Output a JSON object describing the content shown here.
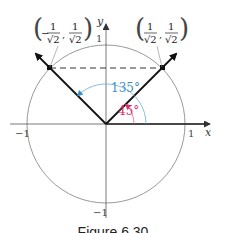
{
  "figure": {
    "caption": "Figure 6.30",
    "axes": {
      "x_label": "x",
      "y_label": "y"
    },
    "ticks": {
      "x_pos": "1",
      "x_neg": "−1",
      "y_pos": "1",
      "y_neg": "−1"
    },
    "points": [
      {
        "label_sign": "−",
        "num": "1",
        "den": "√2",
        "coords": "(−1/√2, 1/√2)"
      },
      {
        "label_sign": "",
        "num": "1",
        "den": "√2",
        "coords": "(1/√2, 1/√2)"
      }
    ],
    "angles": [
      {
        "label": "135°",
        "color": "#3b8fc4"
      },
      {
        "label": "45°",
        "color": "#d6336c"
      }
    ],
    "colors": {
      "circle": "#888888",
      "axis": "#555555",
      "vector": "#111111",
      "blue_arc": "#3b8fc4",
      "red_arc": "#d6336c"
    }
  }
}
